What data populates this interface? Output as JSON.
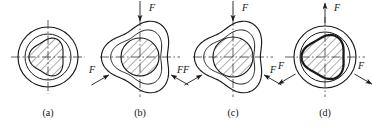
{
  "figure": {
    "title_visible": false,
    "background": "#ffffff",
    "ink": "#1a1a1a",
    "panel_count": 4
  },
  "panels": [
    {
      "id": "a",
      "caption": "(a)",
      "caption_x": 48,
      "caption_y": 116,
      "center": {
        "x": 48,
        "y": 57
      },
      "outer": {
        "type": "circle",
        "rx": 30,
        "ry": 30
      },
      "inner_ring": {
        "type": "circle",
        "rx": 23,
        "ry": 23
      },
      "core": {
        "type": "rounded-triangle",
        "rx": 17,
        "ry": 18,
        "rotation": 0,
        "hatched": true,
        "bold": false
      },
      "centerlines": {
        "vertical": true,
        "horizontal": true,
        "extent": 37
      },
      "forces": []
    },
    {
      "id": "b",
      "caption": "(b)",
      "caption_x": 140,
      "caption_y": 116,
      "center": {
        "x": 140,
        "y": 57
      },
      "outer": {
        "type": "rounded-triangle",
        "rx": 33,
        "ry": 33
      },
      "inner_ring": {
        "type": "rounded-triangle",
        "rx": 25,
        "ry": 25
      },
      "core": {
        "type": "ellipse",
        "rx": 19,
        "ry": 19,
        "hatched": true,
        "bold": false
      },
      "centerlines": {
        "vertical": true,
        "horizontal": true,
        "extent": 40
      },
      "forces": [
        {
          "label": "F",
          "direction": "inward",
          "angle_deg": 90,
          "label_x": 152,
          "label_y": 11
        },
        {
          "label": "F",
          "direction": "inward",
          "angle_deg": 210,
          "label_x": 92,
          "label_y": 73
        },
        {
          "label": "F",
          "direction": "inward",
          "angle_deg": 330,
          "label_x": 180,
          "label_y": 73
        }
      ]
    },
    {
      "id": "c",
      "caption": "(c)",
      "caption_x": 233,
      "caption_y": 116,
      "center": {
        "x": 233,
        "y": 57
      },
      "outer": {
        "type": "rounded-triangle",
        "rx": 33,
        "ry": 33
      },
      "inner_ring": {
        "type": "rounded-triangle",
        "rx": 25,
        "ry": 25
      },
      "core": {
        "type": "circle",
        "rx": 20,
        "ry": 20,
        "hatched": true,
        "bold": false
      },
      "centerlines": {
        "vertical": true,
        "horizontal": true,
        "extent": 40
      },
      "forces": [
        {
          "label": "F",
          "direction": "inward",
          "angle_deg": 90,
          "label_x": 245,
          "label_y": 11
        },
        {
          "label": "F",
          "direction": "inward",
          "angle_deg": 210,
          "label_x": 186,
          "label_y": 73
        },
        {
          "label": "F",
          "direction": "inward",
          "angle_deg": 330,
          "label_x": 273,
          "label_y": 73
        }
      ]
    },
    {
      "id": "d",
      "caption": "(d)",
      "caption_x": 325,
      "caption_y": 116,
      "center": {
        "x": 325,
        "y": 57
      },
      "outer": {
        "type": "circle",
        "rx": 31,
        "ry": 31
      },
      "inner_ring": {
        "type": "circle",
        "rx": 25,
        "ry": 25
      },
      "core": {
        "type": "rounded-triangle",
        "rx": 21,
        "ry": 21,
        "hatched": true,
        "bold": true
      },
      "centerlines": {
        "vertical": true,
        "horizontal": true,
        "extent": 40
      },
      "forces": [
        {
          "label": "F",
          "direction": "outward",
          "angle_deg": 90,
          "label_x": 337,
          "label_y": 11
        },
        {
          "label": "F",
          "direction": "outward",
          "angle_deg": 210,
          "label_x": 281,
          "label_y": 69
        },
        {
          "label": "F",
          "direction": "outward",
          "angle_deg": 330,
          "label_x": 361,
          "label_y": 69
        }
      ]
    }
  ],
  "legend": {
    "force_symbol": "F",
    "hatch_angle_deg": 45
  }
}
